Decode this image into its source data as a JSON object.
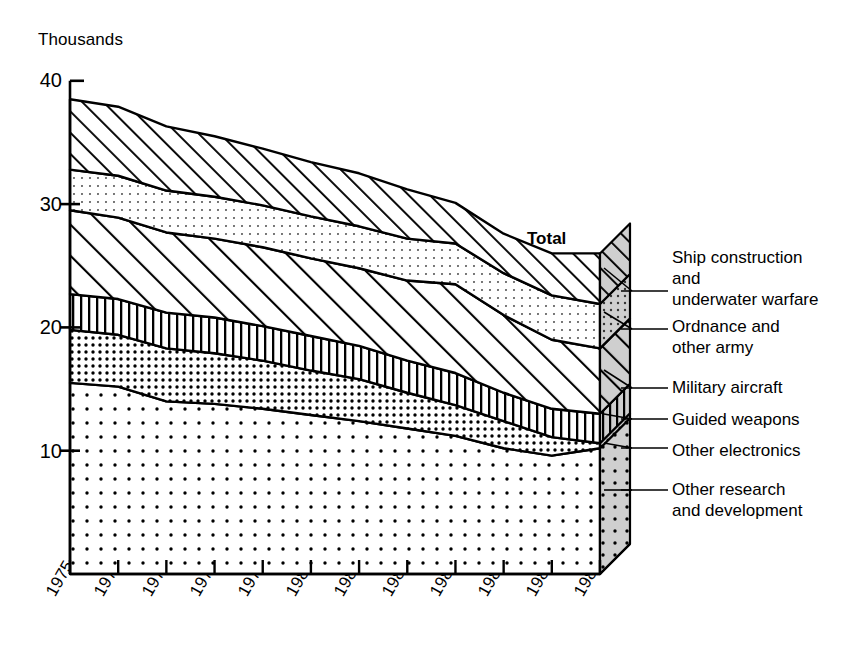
{
  "chart_data": {
    "type": "area",
    "title": "",
    "subtitle": "",
    "xlabel": "",
    "ylabel": "Thousands",
    "unit_label": "Thousands",
    "stacked": true,
    "grid": false,
    "legend_position": "right",
    "annotation": "Total",
    "x": [
      1975,
      1976,
      1977,
      1978,
      1979,
      1980,
      1981,
      1982,
      1983,
      1984,
      1985,
      1986
    ],
    "categories": [
      "1975",
      "1976",
      "1977",
      "1978",
      "1979",
      "1980",
      "1981",
      "1982",
      "1983",
      "1984",
      "1985",
      "1986"
    ],
    "xlim": [
      1975,
      1986
    ],
    "ylim": [
      0,
      40
    ],
    "yticks": [
      10,
      20,
      30,
      40
    ],
    "ytick_labels": [
      "10",
      "20",
      "30",
      "40"
    ],
    "series": [
      {
        "name": "Other research and development",
        "pattern": "sparse-dots",
        "values": [
          15.5,
          15.2,
          14.0,
          13.8,
          13.4,
          12.9,
          12.4,
          11.8,
          11.2,
          10.2,
          9.6,
          10.2
        ]
      },
      {
        "name": "Other electronics",
        "pattern": "dense-dots",
        "values": [
          4.3,
          4.2,
          4.3,
          4.1,
          3.9,
          3.6,
          3.4,
          2.9,
          2.5,
          2.2,
          1.5,
          0.4
        ]
      },
      {
        "name": "Guided weapons",
        "pattern": "vertical-lines",
        "values": [
          2.9,
          2.9,
          2.9,
          2.9,
          2.8,
          2.8,
          2.7,
          2.6,
          2.6,
          2.3,
          2.3,
          2.4
        ]
      },
      {
        "name": "Military aircraft",
        "pattern": "diagonal-hatch-wide",
        "values": [
          6.8,
          6.6,
          6.5,
          6.4,
          6.4,
          6.3,
          6.3,
          6.5,
          7.2,
          6.3,
          5.6,
          5.3
        ]
      },
      {
        "name": "Ordnance and other army",
        "pattern": "fine-dots",
        "values": [
          3.3,
          3.4,
          3.4,
          3.4,
          3.4,
          3.4,
          3.4,
          3.4,
          3.3,
          3.4,
          3.6,
          3.6
        ]
      },
      {
        "name": "Ship construction and underwater warfare",
        "pattern": "diagonal-hatch-narrow",
        "values": [
          5.7,
          5.6,
          5.2,
          4.9,
          4.6,
          4.4,
          4.3,
          4.0,
          3.3,
          3.2,
          3.4,
          4.1
        ]
      }
    ],
    "totals": [
      38.5,
      37.9,
      36.3,
      35.5,
      34.5,
      33.4,
      32.5,
      31.2,
      30.1,
      27.6,
      26.0,
      26.0
    ],
    "cumulative_tops": {
      "other_research_and_development": [
        15.5,
        15.2,
        14.0,
        13.8,
        13.4,
        12.9,
        12.4,
        11.8,
        11.2,
        10.2,
        9.6,
        10.2
      ],
      "other_electronics": [
        19.8,
        19.4,
        18.3,
        17.9,
        17.3,
        16.5,
        15.8,
        14.7,
        13.7,
        12.4,
        11.1,
        10.6
      ],
      "guided_weapons": [
        22.7,
        22.3,
        21.2,
        20.8,
        20.1,
        19.3,
        18.5,
        17.3,
        16.3,
        14.7,
        13.4,
        13.0
      ],
      "military_aircraft": [
        29.5,
        28.9,
        27.7,
        27.2,
        26.5,
        25.6,
        24.8,
        23.8,
        23.5,
        21.0,
        19.0,
        18.3
      ],
      "ordnance_and_other_army": [
        32.8,
        32.3,
        31.1,
        30.6,
        29.9,
        29.0,
        28.2,
        27.2,
        26.8,
        24.4,
        22.6,
        21.9
      ],
      "ship_construction_and_underwater_warfare": [
        38.5,
        37.9,
        36.3,
        35.5,
        34.5,
        33.4,
        32.5,
        31.2,
        30.1,
        27.6,
        26.0,
        26.0
      ]
    }
  },
  "axis": {
    "unit_label": "Thousands",
    "y_ticks": [
      {
        "label": "40",
        "value": 40
      },
      {
        "label": "30",
        "value": 30
      },
      {
        "label": "20",
        "value": 20
      },
      {
        "label": "10",
        "value": 10
      }
    ],
    "x_ticks": [
      {
        "label": "1975"
      },
      {
        "label": "1976"
      },
      {
        "label": "1977"
      },
      {
        "label": "1978"
      },
      {
        "label": "1979"
      },
      {
        "label": "1980"
      },
      {
        "label": "1981"
      },
      {
        "label": "1982"
      },
      {
        "label": "1983"
      },
      {
        "label": "1984"
      },
      {
        "label": "1985"
      },
      {
        "label": "1986"
      }
    ]
  },
  "annotations": {
    "total": "Total"
  },
  "legend": {
    "items": [
      {
        "label": "Ship construction\nand\nunderwater warfare",
        "key": "ship-construction-and-underwater-warfare"
      },
      {
        "label": "Ordnance and\nother army",
        "key": "ordnance-and-other-army"
      },
      {
        "label": "Military aircraft",
        "key": "military-aircraft"
      },
      {
        "label": "Guided weapons",
        "key": "guided-weapons"
      },
      {
        "label": "Other electronics",
        "key": "other-electronics"
      },
      {
        "label": "Other research\nand development",
        "key": "other-research-and-development"
      }
    ]
  },
  "colors": {
    "ink": "#000000",
    "background": "#ffffff",
    "fill_light": "#ffffff",
    "fill_tint": "#e8e8e8",
    "side_face": "#cfcfcf"
  }
}
